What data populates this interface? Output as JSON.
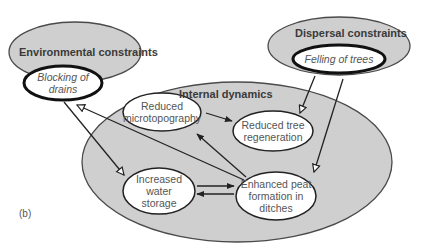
{
  "diagram": {
    "panel_label": "(b)",
    "groups": {
      "environmental": {
        "title": "Environmental constraints"
      },
      "dispersal": {
        "title": "Dispersal constraints"
      },
      "internal": {
        "title": "Internal dynamics"
      }
    },
    "nodes": {
      "blocking": {
        "label_line1": "Blocking of",
        "label_line2": "drains"
      },
      "felling": {
        "label": "Felling of trees"
      },
      "microtopo": {
        "label_line1": "Reduced",
        "label_line2": "microtopography"
      },
      "tree_regen": {
        "label_line1": "Reduced tree",
        "label_line2": "regeneration"
      },
      "water": {
        "label_line1": "Increased",
        "label_line2": "water",
        "label_line3": "storage"
      },
      "peat": {
        "label_line1": "Enhanced peat",
        "label_line2": "formation in",
        "label_line3": "ditches"
      }
    },
    "edges": [
      {
        "from": "Blocking of drains",
        "to": "Increased water storage",
        "head": "open"
      },
      {
        "from": "Felling of trees",
        "to": "Reduced tree regeneration",
        "head": "open"
      },
      {
        "from": "Felling of trees",
        "to": "Enhanced peat formation in ditches",
        "head": "open"
      },
      {
        "from": "Enhanced peat formation in ditches",
        "to": "Blocking of drains",
        "head": "open"
      },
      {
        "from": "Reduced microtopography",
        "to": "Reduced tree regeneration",
        "head": "filled"
      },
      {
        "from": "Enhanced peat formation in ditches",
        "to": "Reduced microtopography",
        "head": "filled"
      },
      {
        "from": "Increased water storage",
        "to": "Enhanced peat formation in ditches",
        "head": "filled"
      },
      {
        "from": "Enhanced peat formation in ditches",
        "to": "Increased water storage",
        "head": "filled"
      }
    ],
    "colors": {
      "group_fill": "#cfcfcf",
      "group_stroke": "#4a4a4a",
      "node_fill": "#ffffff",
      "node_stroke": "#2a2a2a",
      "text": "#555555"
    }
  }
}
